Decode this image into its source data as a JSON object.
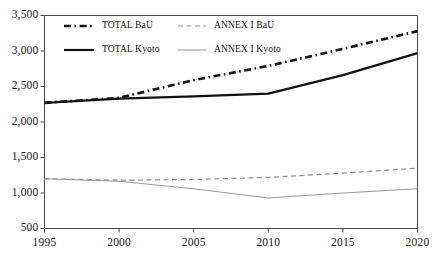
{
  "chart_data": {
    "type": "line",
    "title": "",
    "subtitle": "",
    "xlabel": "",
    "ylabel": "",
    "x": [
      1995,
      2000,
      2005,
      2010,
      2015,
      2020
    ],
    "xlim": [
      1995,
      2020
    ],
    "ylim": [
      500,
      3500
    ],
    "yticks": [
      500,
      1000,
      1500,
      2000,
      2500,
      3000,
      3500
    ],
    "ytick_labels": [
      "500",
      "1,000",
      "1,500",
      "2,000",
      "2,500",
      "3,000",
      "3,500"
    ],
    "xticks": [
      1995,
      2000,
      2005,
      2010,
      2015,
      2020
    ],
    "xtick_labels": [
      "1995",
      "2000",
      "2005",
      "2010",
      "2015",
      "2020"
    ],
    "grid": false,
    "legend_position": "top-left-inside",
    "series": [
      {
        "name": "TOTAL BaU",
        "values": [
          2270,
          2340,
          2590,
          2790,
          3030,
          3280
        ],
        "color": "#111111",
        "style": "dashed",
        "width": 2.6,
        "dasharray": "7,3.5,1.6,3.5"
      },
      {
        "name": "ANNEX I BaU",
        "values": [
          1200,
          1180,
          1190,
          1220,
          1280,
          1350
        ],
        "color": "#8c8c8c",
        "style": "dashed",
        "width": 1.2,
        "dasharray": "5,3.5"
      },
      {
        "name": "TOTAL Kyoto",
        "values": [
          2270,
          2330,
          2360,
          2400,
          2660,
          2970
        ],
        "color": "#111111",
        "style": "solid",
        "width": 2.2,
        "dasharray": ""
      },
      {
        "name": "ANNEX I Kyoto",
        "values": [
          1200,
          1165,
          1060,
          930,
          1000,
          1060
        ],
        "color": "#9a9a9a",
        "style": "solid",
        "width": 1.1,
        "dasharray": ""
      }
    ]
  },
  "axes": {
    "axis_color": "#4a4a4a",
    "frame_top": true,
    "frame_left": true,
    "frame_right": true,
    "frame_bottom": true
  },
  "legend": {
    "entries": [
      {
        "label": "TOTAL BaU",
        "series": "TOTAL BaU"
      },
      {
        "label": "ANNEX I BaU",
        "series": "ANNEX I BaU"
      },
      {
        "label": "TOTAL Kyoto",
        "series": "TOTAL Kyoto"
      },
      {
        "label": "ANNEX I Kyoto",
        "series": "ANNEX I Kyoto"
      }
    ]
  }
}
